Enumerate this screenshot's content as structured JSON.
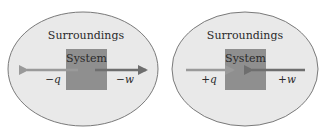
{
  "colors": {
    "ellipse_fill": "#e9e9e9",
    "ellipse_stroke": "#7a7a7a",
    "system_fill": "#8f8f8f",
    "arrow_light": "#9a9a9a",
    "arrow_dark": "#6e6e6e",
    "text": "#2a2a2a"
  },
  "diagrams": [
    {
      "id": "left",
      "surroundings_label": "Surroundings",
      "system_label": "System",
      "heat_label": "−q",
      "work_label": "−w",
      "heat_direction": "out-of-system-left",
      "work_direction": "out-of-system-right"
    },
    {
      "id": "right",
      "surroundings_label": "Surroundings",
      "system_label": "System",
      "heat_label": "+q",
      "work_label": "+w",
      "heat_direction": "into-system-from-left",
      "work_direction": "into-system-from-right"
    }
  ]
}
